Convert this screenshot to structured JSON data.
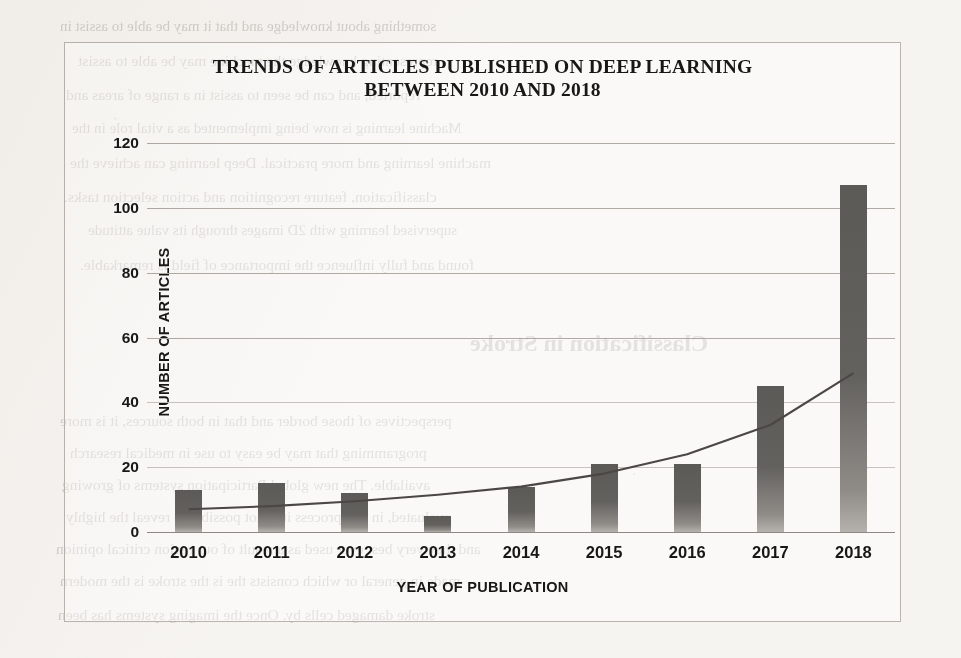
{
  "chart_data": {
    "type": "bar",
    "title": "TRENDS OF ARTICLES PUBLISHED ON DEEP LEARNING BETWEEN 2010 AND 2018",
    "title_line1": "TRENDS OF ARTICLES PUBLISHED ON DEEP LEARNING",
    "title_line2": "BETWEEN 2010 AND 2018",
    "xlabel": "YEAR OF PUBLICATION",
    "ylabel": "NUMBER OF ARTICLES",
    "categories": [
      "2010",
      "2011",
      "2012",
      "2013",
      "2014",
      "2015",
      "2016",
      "2017",
      "2018"
    ],
    "values": [
      13,
      15,
      12,
      5,
      14,
      21,
      21,
      45,
      107
    ],
    "ylim": [
      0,
      120
    ],
    "yticks": [
      0,
      20,
      40,
      60,
      80,
      100,
      120
    ],
    "grid": true,
    "legend": "none",
    "series": [
      {
        "name": "Number of articles",
        "type": "bar",
        "values": [
          13,
          15,
          12,
          5,
          14,
          21,
          21,
          45,
          107
        ]
      },
      {
        "name": "Trendline (exponential)",
        "type": "line",
        "values": [
          7,
          8,
          9.5,
          11.5,
          14,
          18,
          24,
          33,
          49
        ]
      }
    ],
    "colors": {
      "bar": "#5c5a57",
      "trendline": "#4a4744",
      "gridline": "#b0aaa4",
      "text": "#171717",
      "plot_background": "#ffffff",
      "page_background": "#f6f4f1"
    }
  },
  "background_bleed": {
    "note": "mirrored show-through text from the reverse side of the scanned page",
    "lines": [
      "something about knowledge and that it may be able to assist in",
      "representing knowledge the machine may be able to assist",
      "reported, and can be seen to assist in a range of areas and",
      "Machine learning is now being implemented as a vital role in the",
      "machine learning and more practical. Deep learning can achieve the",
      "classification, feature recognition and action selection tasks.",
      "supervised learning with 2D images through its value attitude",
      "found and fully influence the importance of field is remarkable.",
      "Classification in Stroke",
      "perspectives of those border and that in both sources, it is more",
      "programming that may be easy to use in medical research",
      "available. The new global Participation systems of growing",
      "evaluated, in this process it is not possible to reveal the highly",
      "and they very best ever used as a result of our region critical opinion",
      "made in general or which consists the is the stroke is the modern",
      "stroke damaged cells by. Once the imaging systems has been"
    ]
  }
}
